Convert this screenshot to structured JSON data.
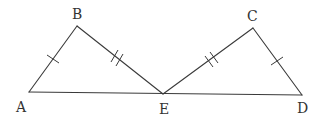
{
  "diagram": {
    "type": "geometry-figure",
    "stroke_color": "#3a3a3a",
    "label_color": "#333333",
    "points": {
      "A": {
        "label": "A",
        "x": 29,
        "y": 92
      },
      "B": {
        "label": "B",
        "x": 77,
        "y": 26
      },
      "E": {
        "label": "E",
        "x": 163,
        "y": 94
      },
      "C": {
        "label": "C",
        "x": 253,
        "y": 28
      },
      "D": {
        "label": "D",
        "x": 302,
        "y": 95
      }
    },
    "segments": [
      {
        "from": "A",
        "to": "B",
        "tick_marks": 1
      },
      {
        "from": "B",
        "to": "E",
        "tick_marks": 2
      },
      {
        "from": "E",
        "to": "C",
        "tick_marks": 2
      },
      {
        "from": "C",
        "to": "D",
        "tick_marks": 1
      },
      {
        "from": "A",
        "to": "D",
        "tick_marks": 0
      }
    ],
    "congruences": [
      {
        "segments": [
          "AB",
          "CD"
        ],
        "marker": "single-tick"
      },
      {
        "segments": [
          "BE",
          "EC"
        ],
        "marker": "double-tick"
      }
    ],
    "labels": {
      "A": "A",
      "B": "B",
      "C": "C",
      "D": "D",
      "E": "E"
    }
  }
}
